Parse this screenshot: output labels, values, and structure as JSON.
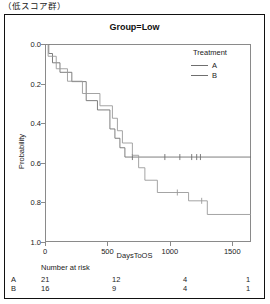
{
  "caption": "（低スコア群）",
  "figure": {
    "title": "Group=Low"
  },
  "legend": {
    "title": "Treatment",
    "entries": [
      {
        "label": "A",
        "color": "#6f6f6f"
      },
      {
        "label": "B",
        "color": "#6f6f6f"
      }
    ]
  },
  "axes": {
    "ylabel": "Probability",
    "xlabel": "DaysToOS",
    "yticks": [
      "1.0",
      "0.8",
      "0.6",
      "0.4",
      "0.2",
      "0.0"
    ],
    "xticks": [
      "0",
      "500",
      "1000",
      "1500"
    ]
  },
  "risk_table": {
    "title": "Number at risk",
    "rows": [
      {
        "label": "A",
        "values": [
          "21",
          "12",
          "4",
          "1"
        ]
      },
      {
        "label": "B",
        "values": [
          "16",
          "9",
          "4",
          "1"
        ]
      }
    ],
    "axis_label": "DaysToOS"
  },
  "chart_data": {
    "type": "line",
    "title": "Group=Low",
    "xlabel": "DaysToOS",
    "ylabel": "Probability",
    "xlim": [
      0,
      1650
    ],
    "ylim": [
      0.0,
      1.0
    ],
    "xticks": [
      0,
      500,
      1000,
      1500
    ],
    "yticks": [
      0.0,
      0.2,
      0.4,
      0.6,
      0.8,
      1.0
    ],
    "grid": false,
    "legend_position": "top-right",
    "series": [
      {
        "name": "A",
        "color": "#6f6f6f",
        "steps": [
          {
            "x": 0,
            "y": 1.0
          },
          {
            "x": 30,
            "y": 0.952
          },
          {
            "x": 60,
            "y": 0.905
          },
          {
            "x": 120,
            "y": 0.857
          },
          {
            "x": 215,
            "y": 0.81
          },
          {
            "x": 330,
            "y": 0.714
          },
          {
            "x": 420,
            "y": 0.667
          },
          {
            "x": 520,
            "y": 0.571
          },
          {
            "x": 560,
            "y": 0.524
          },
          {
            "x": 600,
            "y": 0.476
          },
          {
            "x": 640,
            "y": 0.429
          },
          {
            "x": 1650,
            "y": 0.429
          }
        ],
        "censored_x": [
          700,
          960,
          1080,
          1175,
          1215,
          1245
        ]
      },
      {
        "name": "B",
        "color": "#9a9a9a",
        "steps": [
          {
            "x": 0,
            "y": 1.0
          },
          {
            "x": 25,
            "y": 0.938
          },
          {
            "x": 90,
            "y": 0.875
          },
          {
            "x": 180,
            "y": 0.812
          },
          {
            "x": 300,
            "y": 0.75
          },
          {
            "x": 440,
            "y": 0.688
          },
          {
            "x": 540,
            "y": 0.625
          },
          {
            "x": 580,
            "y": 0.562
          },
          {
            "x": 620,
            "y": 0.5
          },
          {
            "x": 700,
            "y": 0.438
          },
          {
            "x": 750,
            "y": 0.375
          },
          {
            "x": 800,
            "y": 0.312
          },
          {
            "x": 900,
            "y": 0.25
          },
          {
            "x": 1150,
            "y": 0.208
          },
          {
            "x": 1300,
            "y": 0.139
          },
          {
            "x": 1650,
            "y": 0.139
          }
        ],
        "censored_x": [
          1060,
          1255
        ]
      }
    ]
  }
}
